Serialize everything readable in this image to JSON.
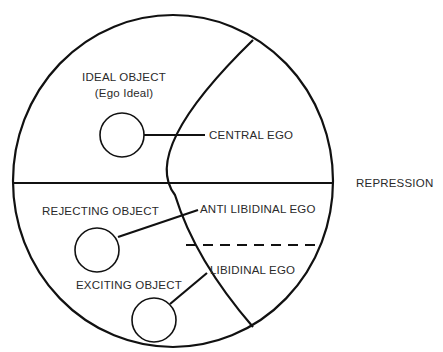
{
  "diagram": {
    "objects": {
      "ideal": {
        "label": "IDEAL OBJECT",
        "sublabel": "(Ego Ideal)"
      },
      "rejecting": {
        "label": "REJECTING OBJECT"
      },
      "exciting": {
        "label": "EXCITING OBJECT"
      }
    },
    "egos": {
      "central": {
        "label": "CENTRAL EGO"
      },
      "antilibidinal": {
        "label": "ANTI LIBIDINAL EGO"
      },
      "libidinal": {
        "label": "LIBIDINAL EGO"
      }
    },
    "repression": {
      "label": "REPRESSION"
    },
    "colors": {
      "stroke": "#111111",
      "text": "#2a2a2a",
      "background": "#ffffff"
    }
  }
}
